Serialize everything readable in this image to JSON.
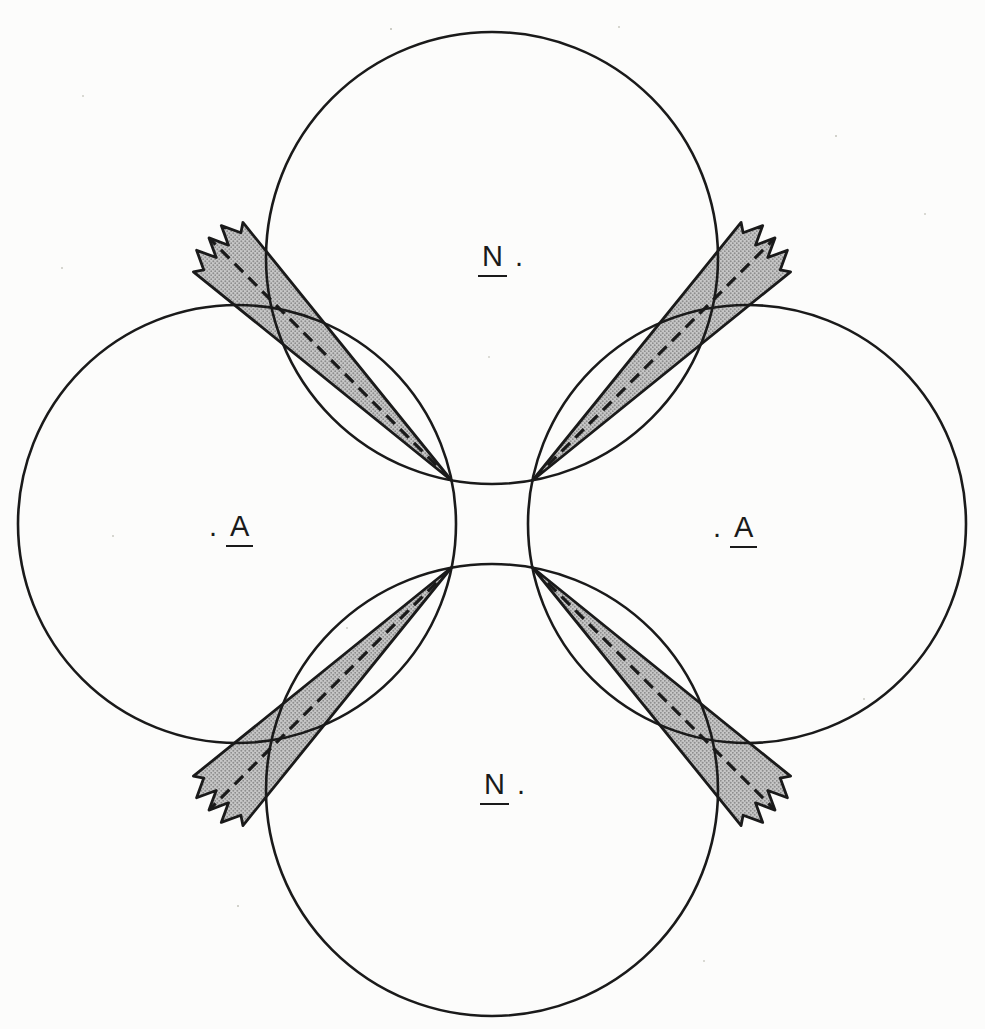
{
  "figure": {
    "colors": {
      "line": "#1a1a1a",
      "paper": "#fcfcfb",
      "shade-base": "#c7c7c7",
      "shade-dot": "#8e8e8e"
    },
    "labels": {
      "top": {
        "letter": "N",
        "dot": "."
      },
      "left": {
        "letter": "A",
        "dot": "."
      },
      "right": {
        "letter": "A",
        "dot": "."
      },
      "bottom": {
        "letter": "N",
        "dot": "."
      }
    }
  }
}
